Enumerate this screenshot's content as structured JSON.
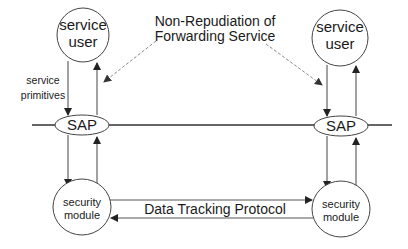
{
  "diagram": {
    "title_line1": "Non-Repudiation of",
    "title_line2": "Forwarding Service",
    "left": {
      "service_user_line1": "service",
      "service_user_line2": "user",
      "service_primitives_line1": "service",
      "service_primitives_line2": "primitives",
      "sap": "SAP",
      "security_module_line1": "security",
      "security_module_line2": "module"
    },
    "right": {
      "service_user_line1": "service",
      "service_user_line2": "user",
      "sap": "SAP",
      "security_module_line1": "security",
      "security_module_line2": "module"
    },
    "protocol_label": "Data Tracking Protocol",
    "colors": {
      "stroke": "#333333",
      "dashed": "#888888",
      "text": "#1a1a1a",
      "background": "#ffffff"
    }
  }
}
